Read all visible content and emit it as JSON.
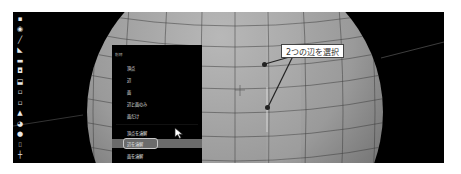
{
  "viewport": {
    "background": "#000000",
    "object": "uv-sphere-wireframe",
    "sphere_color": "#9a9a9a"
  },
  "toolbar": {
    "tools": [
      {
        "name": "select-box-icon",
        "glyph": "▪"
      },
      {
        "name": "cursor-icon",
        "glyph": "◉"
      },
      {
        "name": "annotate-icon",
        "glyph": "╱"
      },
      {
        "name": "measure-icon",
        "glyph": "◣"
      },
      {
        "name": "extrude-icon",
        "glyph": "▬"
      },
      {
        "name": "inset-icon",
        "glyph": "◘"
      },
      {
        "name": "bevel-icon",
        "glyph": "⬓"
      },
      {
        "name": "loop-cut-icon",
        "glyph": "▫"
      },
      {
        "name": "knife-icon",
        "glyph": "▫"
      },
      {
        "name": "poly-build-icon",
        "glyph": "▲"
      },
      {
        "name": "spin-icon",
        "glyph": "◕"
      },
      {
        "name": "smooth-icon",
        "glyph": "●"
      },
      {
        "name": "shear-icon",
        "glyph": "⌷"
      },
      {
        "name": "rip-icon",
        "glyph": "┼"
      }
    ]
  },
  "menu": {
    "title": "削除",
    "items": [
      {
        "label": "頂点",
        "active": false
      },
      {
        "label": "辺",
        "active": false
      },
      {
        "label": "面",
        "active": false
      },
      {
        "label": "辺と面のみ",
        "active": false
      },
      {
        "label": "面だけ",
        "active": false
      },
      {
        "label": "頂点を溶解",
        "active": false
      },
      {
        "label": "辺を溶解",
        "active": true
      },
      {
        "label": "面を溶解",
        "active": false
      }
    ],
    "highlight_color": "#6b6b6b"
  },
  "annotation": {
    "callout_text": "2つの辺を選択"
  }
}
